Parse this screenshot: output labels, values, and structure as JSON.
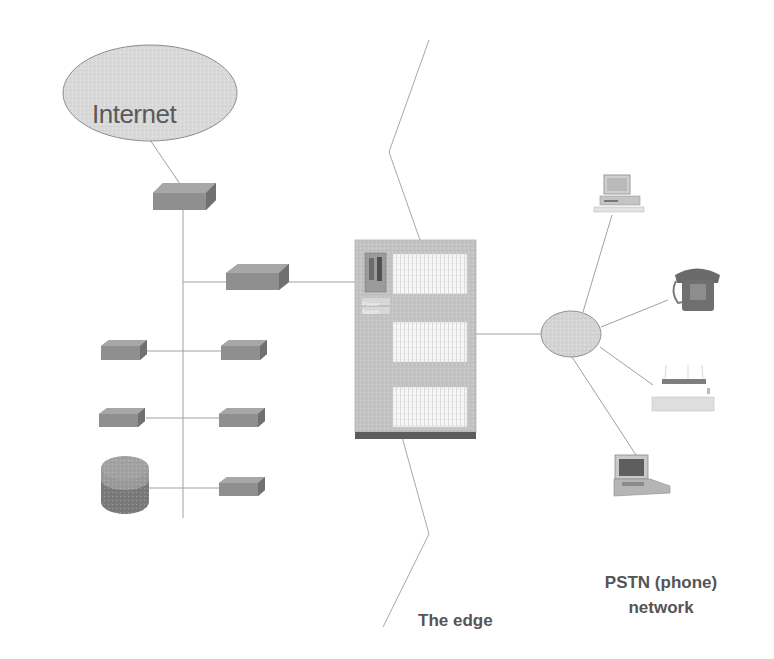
{
  "diagram": {
    "internet": {
      "label": "Internet",
      "fill": "#d9d9d9",
      "stroke": "#8c8c8c"
    },
    "edge_label": "The edge",
    "pstn_label_line1": "PSTN (phone)",
    "pstn_label_line2": "network",
    "switch_label_line1": "Power",
    "switch_label_line2": "Switch",
    "colors": {
      "device_fill": "#8e8e8e",
      "device_top": "#a9a9a9",
      "device_side": "#6f6f6f",
      "switch_body": "#c4c4c4",
      "switch_base": "#5d5d5d",
      "line": "#9a9a9a",
      "text": "#555555"
    },
    "nodes": [
      {
        "id": "internet-cloud",
        "type": "ellipse"
      },
      {
        "id": "router-top",
        "type": "router"
      },
      {
        "id": "router-mid",
        "type": "router"
      },
      {
        "id": "lan-device-1-left",
        "type": "router"
      },
      {
        "id": "lan-device-1-right",
        "type": "router"
      },
      {
        "id": "lan-device-2-left",
        "type": "router"
      },
      {
        "id": "lan-device-2-right",
        "type": "router"
      },
      {
        "id": "database",
        "type": "cylinder"
      },
      {
        "id": "lan-device-3-right",
        "type": "router"
      },
      {
        "id": "edge-switch",
        "type": "switch-cabinet"
      },
      {
        "id": "pstn-cloud",
        "type": "ellipse"
      },
      {
        "id": "desktop-computer",
        "type": "computer"
      },
      {
        "id": "telephone",
        "type": "phone"
      },
      {
        "id": "fax-printer",
        "type": "printer"
      },
      {
        "id": "laptop",
        "type": "laptop"
      }
    ]
  }
}
